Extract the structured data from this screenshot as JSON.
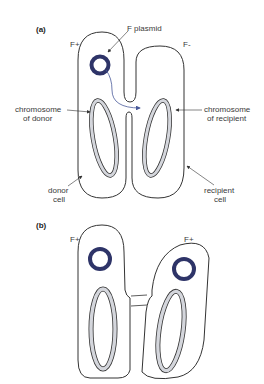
{
  "panel_a": {
    "label": "(a)",
    "donor_type": "F+",
    "recipient_type": "F-",
    "plasmid_label": "F plasmid",
    "donor_chromosome_label": [
      "chromosome",
      "of donor"
    ],
    "recipient_chromosome_label": [
      "chromosome",
      "of recipient"
    ],
    "donor_cell_label": [
      "donor",
      "cell"
    ],
    "recipient_cell_label": [
      "recipient",
      "cell"
    ]
  },
  "panel_b": {
    "label": "(b)",
    "left_cell_type": "F+",
    "right_cell_type": "F+"
  },
  "colors": {
    "plasmid": "#2e3468",
    "chromosome_fill": "#d4d6dc",
    "outline": "#333333",
    "arrow": "#4a5a9a"
  }
}
